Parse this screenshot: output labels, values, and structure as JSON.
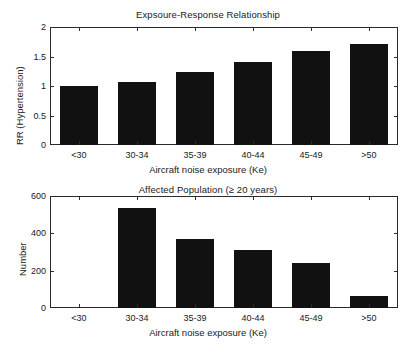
{
  "figure": {
    "width": 416,
    "height": 356,
    "background": "#ffffff",
    "bar_color": "#111111",
    "axis_color": "#2b2b2b"
  },
  "chart_data": [
    {
      "type": "bar",
      "id": "exposure-response",
      "title": "Expsoure-Response Relationship",
      "xlabel": "Aircraft noise exposure (Ke)",
      "ylabel": "RR (Hypertension)",
      "categories": [
        "<30",
        "30-34",
        "35-39",
        "40-44",
        "45-49",
        ">50"
      ],
      "values": [
        1.0,
        1.07,
        1.24,
        1.41,
        1.59,
        1.72
      ],
      "ylim": [
        0,
        2
      ],
      "yticks": [
        0,
        0.5,
        1,
        1.5,
        2
      ],
      "ytick_labels": [
        "0",
        "0.5",
        "1",
        "1.5",
        "2"
      ],
      "grid": false,
      "legend": null
    },
    {
      "type": "bar",
      "id": "affected-population",
      "title": "Affected Population (≥ 20 years)",
      "xlabel": "Aircraft noise exposure (Ke)",
      "ylabel": "Number",
      "categories": [
        "<30",
        "30-34",
        "35-39",
        "40-44",
        "45-49",
        ">50"
      ],
      "values": [
        0,
        535,
        370,
        310,
        242,
        65
      ],
      "ylim": [
        0,
        600
      ],
      "yticks": [
        0,
        200,
        400,
        600
      ],
      "ytick_labels": [
        "0",
        "200",
        "400",
        "600"
      ],
      "grid": false,
      "legend": null
    }
  ]
}
